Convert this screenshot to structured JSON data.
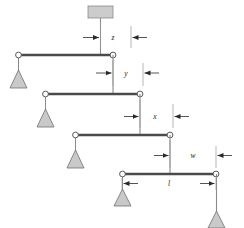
{
  "figure": {
    "type": "mechanical-schematic",
    "background_color": "#ffffff",
    "beam_color": "#4a4a4a",
    "line_color": "#7a7a7a",
    "support_fill": "#c9c9c9",
    "joint_fill": "#ffffff",
    "block_fill": "#cccccc"
  },
  "labels": {
    "z": "z",
    "y": "y",
    "x": "x",
    "w": "w",
    "l": "l"
  },
  "dimensions": [
    {
      "name": "z",
      "label": "z",
      "stage": 1,
      "arrow_style": "inward",
      "y": 37
    },
    {
      "name": "y",
      "label": "y",
      "stage": 2,
      "arrow_style": "inward",
      "y": 72
    },
    {
      "name": "x",
      "label": "x",
      "stage": 3,
      "arrow_style": "inward",
      "y": 116
    },
    {
      "name": "w",
      "label": "w",
      "stage": 4,
      "arrow_style": "inward",
      "y": 155
    },
    {
      "name": "l",
      "label": "l",
      "stage": 4,
      "arrow_style": "outward",
      "y": 183
    }
  ],
  "beams": [
    {
      "index": 1,
      "x1": 18,
      "x2": 113,
      "y": 55
    },
    {
      "index": 2,
      "x1": 45,
      "x2": 140,
      "y": 94
    },
    {
      "index": 3,
      "x1": 75,
      "x2": 170,
      "y": 135
    },
    {
      "index": 4,
      "x1": 122,
      "x2": 216,
      "y": 174
    }
  ],
  "joints": [
    {
      "name": "joint-1-left",
      "cx": 18,
      "cy": 55
    },
    {
      "name": "joint-1-right",
      "cx": 113,
      "cy": 55
    },
    {
      "name": "joint-2-left",
      "cx": 45,
      "cy": 94
    },
    {
      "name": "joint-2-right",
      "cx": 140,
      "cy": 94
    },
    {
      "name": "joint-3-left",
      "cx": 75,
      "cy": 135
    },
    {
      "name": "joint-3-right",
      "cx": 170,
      "cy": 135
    },
    {
      "name": "joint-4-left",
      "cx": 122,
      "cy": 174
    },
    {
      "name": "joint-4-right",
      "cx": 216,
      "cy": 174
    }
  ],
  "supports": [
    {
      "name": "support-1",
      "cx": 18,
      "top": 55,
      "apex": 72
    },
    {
      "name": "support-2",
      "cx": 45,
      "top": 94,
      "apex": 110
    },
    {
      "name": "support-3",
      "cx": 75,
      "top": 135,
      "apex": 151
    },
    {
      "name": "support-4",
      "cx": 122,
      "top": 174,
      "apex": 190
    },
    {
      "name": "support-5",
      "cx": 216,
      "top": 174,
      "apex": 212
    }
  ],
  "hanging_block": {
    "name": "top-weight-block",
    "x": 88,
    "y": 6,
    "width": 25,
    "height": 12,
    "stem_x": 100,
    "stem_top": 18,
    "stem_bottom": 55
  }
}
